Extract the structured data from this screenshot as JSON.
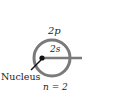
{
  "diagram": {
    "shell_label": "2p",
    "inner_label": "2s",
    "nucleus_label": "Nucleus",
    "quantum_label": "n = 2",
    "colors": {
      "ring": "#7a7a7a",
      "line": "#7a7a7a",
      "nucleus": "#111111",
      "text": "#222222"
    }
  }
}
